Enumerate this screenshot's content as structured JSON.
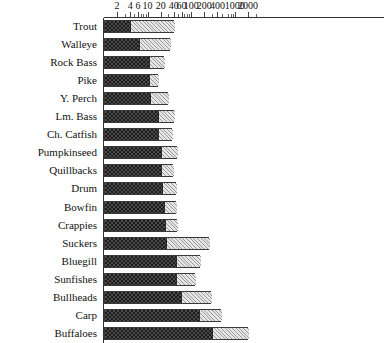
{
  "chart_data": {
    "type": "bar",
    "orientation": "horizontal",
    "stacked": true,
    "title": "",
    "subtitle": "",
    "xlabel": "",
    "ylabel": "",
    "xscale": "log",
    "xlim": [
      1,
      3000
    ],
    "grid": false,
    "legend": [],
    "legend_position": "none",
    "xticks": [
      2,
      4,
      6,
      10,
      20,
      40,
      60,
      100,
      200,
      400,
      1000,
      2000
    ],
    "xticklabels": [
      "2",
      "4",
      "6",
      "10",
      "20",
      "40",
      "60",
      "100",
      "200",
      "400",
      "1000",
      "2000"
    ],
    "categories": [
      "Trout",
      "Walleye",
      "Rock Bass",
      "Pike",
      "Y. Perch",
      "Lm. Bass",
      "Ch. Catfish",
      "Pumpkinseed",
      "Quillbacks",
      "Drum",
      "Bowfin",
      "Crappies",
      "Suckers",
      "Bluegill",
      "Sunfishes",
      "Bullheads",
      "Carp",
      "Buffaloes"
    ],
    "series": [
      {
        "name": "dark-segment",
        "pattern": "checkerboard",
        "color": "#2a2a2a",
        "values": [
          4.0,
          6.2,
          11.0,
          10.5,
          11.5,
          17.5,
          17.0,
          20.0,
          20.5,
          21.0,
          23.5,
          25.0,
          26.5,
          44.0,
          44.0,
          58.0,
          150.0,
          300.0
        ]
      },
      {
        "name": "light-segment",
        "pattern": "hatched",
        "color": "#d9d9d9",
        "values": [
          36.0,
          25.5,
          12.5,
          6.5,
          18.0,
          24.0,
          19.0,
          28.0,
          18.0,
          24.0,
          22.0,
          23.0,
          220.0,
          115.0,
          80.0,
          235.0,
          330.0,
          1700.0
        ]
      }
    ],
    "totals": [
      40,
      32,
      24,
      17,
      30,
      41,
      36,
      48,
      38,
      45,
      45,
      48,
      250,
      160,
      125,
      290,
      480,
      2000
    ]
  },
  "axis": {
    "ticks": [
      {
        "value": 2,
        "label": "2"
      },
      {
        "value": 4,
        "label": "4"
      },
      {
        "value": 6,
        "label": "6"
      },
      {
        "value": 10,
        "label": "10"
      },
      {
        "value": 20,
        "label": "20"
      },
      {
        "value": 40,
        "label": "40"
      },
      {
        "value": 60,
        "label": "60"
      },
      {
        "value": 100,
        "label": "100"
      },
      {
        "value": 200,
        "label": "200"
      },
      {
        "value": 400,
        "label": "400"
      },
      {
        "value": 1000,
        "label": "1000"
      },
      {
        "value": 2000,
        "label": "2000"
      }
    ],
    "minor_ticks": [
      3,
      5,
      7,
      8,
      9,
      30,
      50,
      70,
      80,
      90,
      300,
      500,
      700,
      800,
      900,
      3000
    ]
  }
}
